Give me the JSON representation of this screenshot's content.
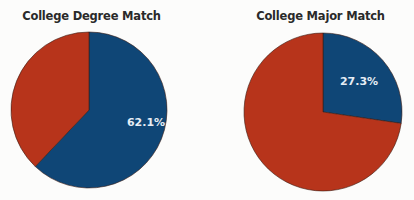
{
  "chart_data": [
    {
      "type": "pie",
      "title": "College Degree Match",
      "slices": [
        {
          "label": "Match",
          "value": 62.1,
          "color": "#0f4676",
          "label_text": "62.1%"
        },
        {
          "label": "No match",
          "value": 37.9,
          "color": "#b7341b",
          "label_text": ""
        }
      ]
    },
    {
      "type": "pie",
      "title": "College Major Match",
      "slices": [
        {
          "label": "Match",
          "value": 27.3,
          "color": "#0f4676",
          "label_text": "27.3%"
        },
        {
          "label": "No match",
          "value": 72.7,
          "color": "#b7341b",
          "label_text": ""
        }
      ]
    }
  ],
  "charts": {
    "left": {
      "title": "College Degree Match",
      "label": "62.1%"
    },
    "right": {
      "title": "College Major Match",
      "label": "27.3%"
    }
  }
}
